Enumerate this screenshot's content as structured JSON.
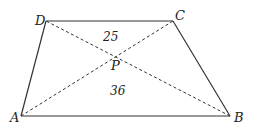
{
  "diagram": {
    "type": "trapezoid-with-diagonals",
    "colors": {
      "stroke": "#333333",
      "text": "#222222",
      "background": "#ffffff"
    },
    "vertices": {
      "A": {
        "label": "A",
        "x": 21,
        "y": 116
      },
      "B": {
        "label": "B",
        "x": 230,
        "y": 116
      },
      "C": {
        "label": "C",
        "x": 173,
        "y": 21
      },
      "D": {
        "label": "D",
        "x": 46,
        "y": 21
      }
    },
    "intersection": {
      "label": "P",
      "x": 116,
      "y": 57
    },
    "areas": {
      "top_triangle_DPC": "25",
      "bottom_triangle_APB": "36"
    }
  }
}
